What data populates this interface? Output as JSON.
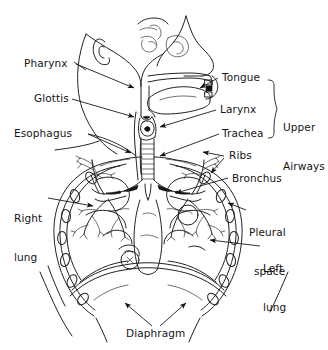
{
  "figure": {
    "background_color": "#ffffff",
    "line_color": "#222222",
    "text_color": "#141414"
  },
  "labels": {
    "pharynx": "Pharynx",
    "glottis": "Glottis",
    "esophagus": "Esophagus",
    "tongue": "Tongue",
    "larynx": "Larynx",
    "trachea": "Trachea",
    "upper_airways_line1": "Upper",
    "upper_airways_line2": "Airways",
    "ribs": "Ribs",
    "bronchus": "Bronchus",
    "pleural_space_line1": "Pleural",
    "pleural_space_line2": "space",
    "right_lung_line1": "Right",
    "right_lung_line2": "lung",
    "left_lung_line1": "Left",
    "left_lung_line2": "lung",
    "diaphragm": "Diaphragm"
  },
  "structures": [
    "head-profile",
    "ear",
    "nasal-cavity",
    "hard-palate",
    "tongue",
    "pharynx",
    "glottis",
    "larynx",
    "esophagus",
    "trachea",
    "carina",
    "right-main-bronchus",
    "left-main-bronchus",
    "bronchial-tree",
    "right-lung",
    "left-lung",
    "rib-cage",
    "pleural-space",
    "diaphragm"
  ],
  "icons": {
    "arrowhead": "arrow-icon",
    "brace": "curly-brace-icon"
  }
}
